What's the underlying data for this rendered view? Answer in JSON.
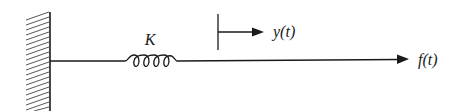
{
  "diagram": {
    "elements": {
      "wall": {
        "type": "fixed-support",
        "hatched": true
      },
      "spring": {
        "label": "K"
      },
      "displacement": {
        "label": "y(t)",
        "direction": "right"
      },
      "force": {
        "label": "f(t)",
        "direction": "right"
      }
    },
    "colors": {
      "stroke": "#1a1a1a",
      "background": "#ffffff"
    }
  }
}
